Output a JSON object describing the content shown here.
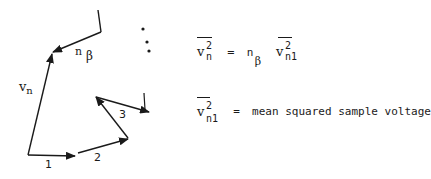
{
  "diagram": {
    "vector_labels": {
      "v1": "1",
      "v2": "2",
      "v3": "3",
      "resultant": "v",
      "resultant_sub": "n",
      "nbeta": "n",
      "nbeta_sub": "β"
    },
    "ellipsis_dots": 3
  },
  "equations": {
    "eq1": {
      "lhs_base": "v",
      "lhs_sup": "2",
      "lhs_sub": "n",
      "equals": "=",
      "coef_base": "n",
      "coef_sub": "β",
      "rhs_base": "v",
      "rhs_sup": "2",
      "rhs_sub": "n1"
    },
    "eq2": {
      "lhs_base": "v",
      "lhs_sup": "2",
      "lhs_sub": "n1",
      "equals": "=",
      "definition": "mean squared sample voltage"
    }
  },
  "colors": {
    "ink": "#1a1a1a",
    "background": "#ffffff"
  }
}
